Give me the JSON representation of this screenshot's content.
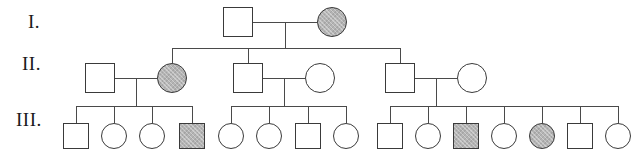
{
  "figure": {
    "type": "pedigree-chart",
    "title": "",
    "width": 637,
    "height": 158,
    "background_color": "#ffffff",
    "line_color": "#4a4a4a",
    "symbol_stroke_color": "#3a3a3a",
    "affected_fill_color": "#b4b4b4",
    "unaffected_fill_color": "#ffffff",
    "legend": {
      "square": "male",
      "circle": "female",
      "shaded": "affected",
      "unshaded": "unaffected"
    }
  },
  "generation_labels": [
    {
      "id": "gen-1-label",
      "text": "I.",
      "x": 28,
      "y": 22
    },
    {
      "id": "gen-2-label",
      "text": "II.",
      "x": 22,
      "y": 64
    },
    {
      "id": "gen-3-label",
      "text": "III.",
      "x": 16,
      "y": 120
    }
  ],
  "generations": [
    {
      "id": "generation-1",
      "label": "I.",
      "row_y": 22,
      "individuals": [
        {
          "id": "I-1",
          "sex": "male",
          "shape": "square",
          "affected": false,
          "cx": 238,
          "cy": 22,
          "size": 30
        },
        {
          "id": "I-2",
          "sex": "female",
          "shape": "circle",
          "affected": true,
          "cx": 332,
          "cy": 22,
          "size": 30
        }
      ],
      "count": 2,
      "affected_count": 1
    },
    {
      "id": "generation-2",
      "label": "II.",
      "row_y": 78,
      "individuals": [
        {
          "id": "II-1",
          "sex": "male",
          "shape": "square",
          "affected": false,
          "cx": 100,
          "cy": 78,
          "size": 30
        },
        {
          "id": "II-2",
          "sex": "female",
          "shape": "circle",
          "affected": true,
          "cx": 172,
          "cy": 78,
          "size": 30
        },
        {
          "id": "II-3",
          "sex": "male",
          "shape": "square",
          "affected": false,
          "cx": 248,
          "cy": 78,
          "size": 30
        },
        {
          "id": "II-4",
          "sex": "female",
          "shape": "circle",
          "affected": false,
          "cx": 320,
          "cy": 78,
          "size": 30
        },
        {
          "id": "II-5",
          "sex": "male",
          "shape": "square",
          "affected": false,
          "cx": 400,
          "cy": 78,
          "size": 30
        },
        {
          "id": "II-6",
          "sex": "female",
          "shape": "circle",
          "affected": false,
          "cx": 472,
          "cy": 78,
          "size": 30
        }
      ],
      "count": 6,
      "affected_count": 1
    },
    {
      "id": "generation-3",
      "label": "III.",
      "row_y": 136,
      "individuals": [
        {
          "id": "III-1",
          "sex": "male",
          "shape": "square",
          "affected": false,
          "cx": 76,
          "cy": 136,
          "size": 26
        },
        {
          "id": "III-2",
          "sex": "female",
          "shape": "circle",
          "affected": false,
          "cx": 114,
          "cy": 136,
          "size": 26
        },
        {
          "id": "III-3",
          "sex": "female",
          "shape": "circle",
          "affected": false,
          "cx": 152,
          "cy": 136,
          "size": 26
        },
        {
          "id": "III-4",
          "sex": "male",
          "shape": "square",
          "affected": true,
          "cx": 192,
          "cy": 136,
          "size": 26
        },
        {
          "id": "III-5",
          "sex": "female",
          "shape": "circle",
          "affected": false,
          "cx": 231,
          "cy": 136,
          "size": 26
        },
        {
          "id": "III-6",
          "sex": "female",
          "shape": "circle",
          "affected": false,
          "cx": 269,
          "cy": 136,
          "size": 26
        },
        {
          "id": "III-7",
          "sex": "male",
          "shape": "square",
          "affected": false,
          "cx": 308,
          "cy": 136,
          "size": 26
        },
        {
          "id": "III-8",
          "sex": "female",
          "shape": "circle",
          "affected": false,
          "cx": 346,
          "cy": 136,
          "size": 26
        },
        {
          "id": "III-9",
          "sex": "male",
          "shape": "square",
          "affected": false,
          "cx": 390,
          "cy": 136,
          "size": 26
        },
        {
          "id": "III-10",
          "sex": "female",
          "shape": "circle",
          "affected": false,
          "cx": 428,
          "cy": 136,
          "size": 26
        },
        {
          "id": "III-11",
          "sex": "male",
          "shape": "square",
          "affected": true,
          "cx": 466,
          "cy": 136,
          "size": 26
        },
        {
          "id": "III-12",
          "sex": "female",
          "shape": "circle",
          "affected": false,
          "cx": 504,
          "cy": 136,
          "size": 26
        },
        {
          "id": "III-13",
          "sex": "female",
          "shape": "circle",
          "affected": true,
          "cx": 542,
          "cy": 136,
          "size": 26
        },
        {
          "id": "III-14",
          "sex": "male",
          "shape": "square",
          "affected": false,
          "cx": 580,
          "cy": 136,
          "size": 26
        },
        {
          "id": "III-15",
          "sex": "female",
          "shape": "circle",
          "affected": false,
          "cx": 618,
          "cy": 136,
          "size": 26
        }
      ],
      "count": 15,
      "affected_count": 3
    }
  ],
  "matings": [
    {
      "id": "mating-I",
      "partners": [
        "I-1",
        "I-2"
      ],
      "y": 22,
      "x1": 253,
      "x2": 317,
      "drop_x": 285,
      "drop_y1": 22,
      "drop_y2": 48
    },
    {
      "id": "mating-II-left",
      "partners": [
        "II-1",
        "II-2"
      ],
      "y": 78,
      "x1": 115,
      "x2": 157,
      "drop_x": 136,
      "drop_y1": 78,
      "drop_y2": 106
    },
    {
      "id": "mating-II-middle",
      "partners": [
        "II-3",
        "II-4"
      ],
      "y": 78,
      "x1": 263,
      "x2": 305,
      "drop_x": 284,
      "drop_y1": 78,
      "drop_y2": 106
    },
    {
      "id": "mating-II-right",
      "partners": [
        "II-5",
        "II-6"
      ],
      "y": 78,
      "x1": 415,
      "x2": 457,
      "drop_x": 436,
      "drop_y1": 78,
      "drop_y2": 106
    }
  ],
  "sibships": [
    {
      "id": "sibship-I",
      "parents": "mating-I",
      "sibling_bar_y": 48,
      "bar_x1": 172,
      "bar_x2": 400,
      "children": [
        "II-2",
        "II-3",
        "II-5"
      ],
      "child_drop_xs": [
        172,
        248,
        400
      ],
      "drop_y1": 48,
      "drop_y2": 63
    },
    {
      "id": "sibship-II-left",
      "parents": "mating-II-left",
      "sibling_bar_y": 106,
      "bar_x1": 76,
      "bar_x2": 192,
      "children": [
        "III-1",
        "III-2",
        "III-3",
        "III-4"
      ],
      "child_drop_xs": [
        76,
        114,
        152,
        192
      ],
      "drop_y1": 106,
      "drop_y2": 123
    },
    {
      "id": "sibship-II-middle",
      "parents": "mating-II-middle",
      "sibling_bar_y": 106,
      "bar_x1": 231,
      "bar_x2": 346,
      "children": [
        "III-5",
        "III-6",
        "III-7",
        "III-8"
      ],
      "child_drop_xs": [
        231,
        269,
        308,
        346
      ],
      "drop_y1": 106,
      "drop_y2": 123
    },
    {
      "id": "sibship-II-right",
      "parents": "mating-II-right",
      "sibling_bar_y": 106,
      "bar_x1": 390,
      "bar_x2": 618,
      "children": [
        "III-9",
        "III-10",
        "III-11",
        "III-12",
        "III-13",
        "III-14",
        "III-15"
      ],
      "child_drop_xs": [
        390,
        428,
        466,
        504,
        542,
        580,
        618
      ],
      "drop_y1": 106,
      "drop_y2": 123
    }
  ],
  "summary": {
    "total_individuals": 23,
    "total_affected": 5,
    "generation_count": 3
  }
}
